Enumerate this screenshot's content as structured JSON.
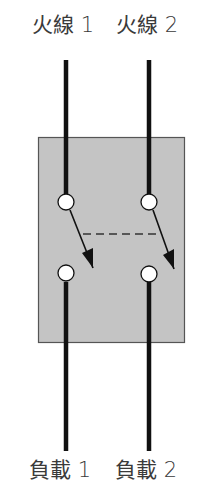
{
  "diagram": {
    "type": "double-pole switch schematic",
    "top_labels": [
      {
        "text": "火線 1"
      },
      {
        "text": "火線 2"
      }
    ],
    "bottom_labels": [
      {
        "text": "負載 1"
      },
      {
        "text": "負載 2"
      }
    ],
    "colors": {
      "background": "#ffffff",
      "switch_body": "#c4c4c4",
      "switch_border": "#555555",
      "wire": "#111111",
      "terminal_fill": "#ffffff",
      "text": "#3a3a3a"
    },
    "poles": [
      {
        "name": "pole-1",
        "input": "火線 1",
        "output": "負載 1"
      },
      {
        "name": "pole-2",
        "input": "火線 2",
        "output": "負載 2"
      }
    ],
    "mechanical_link": "dashed line linking both switch blades"
  }
}
